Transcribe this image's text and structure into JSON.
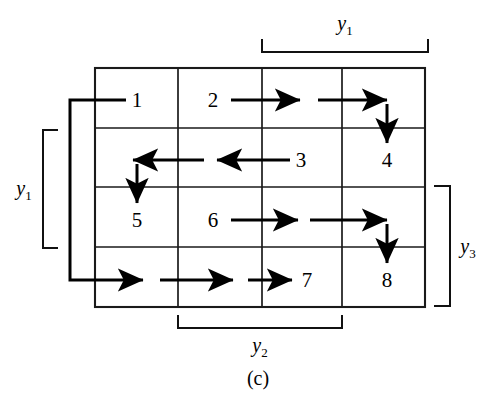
{
  "figure": {
    "caption": "(c)",
    "caption_position": {
      "x": 258,
      "y": 385
    },
    "background_color": "#ffffff",
    "line_color": "#000000"
  },
  "grid": {
    "columns": 4,
    "rows": 4,
    "left": 95,
    "right": 425,
    "top": 68,
    "bottom": 307,
    "column_dividers": [
      178,
      262,
      342
    ],
    "row_dividers": [
      128,
      187,
      247
    ],
    "outer_stroke_width": 2.1,
    "inner_stroke_width": 1.7
  },
  "cells": [
    {
      "label": "1",
      "x": 137,
      "y": 107,
      "row": 1,
      "col": 1
    },
    {
      "label": "2",
      "x": 213,
      "y": 107,
      "row": 1,
      "col": 2
    },
    {
      "label": "3",
      "x": 301,
      "y": 167,
      "row": 2,
      "col": 3
    },
    {
      "label": "4",
      "x": 387,
      "y": 167,
      "row": 2,
      "col": 4
    },
    {
      "label": "5",
      "x": 137,
      "y": 227,
      "row": 3,
      "col": 1
    },
    {
      "label": "6",
      "x": 213,
      "y": 227,
      "row": 3,
      "col": 2
    },
    {
      "label": "7",
      "x": 307,
      "y": 287,
      "row": 4,
      "col": 3
    },
    {
      "label": "8",
      "x": 387,
      "y": 287,
      "row": 4,
      "col": 4
    }
  ],
  "brackets": [
    {
      "id": "bracket-top",
      "label": "y",
      "subscript": "1",
      "orientation": "horizontal-top",
      "span_start": 262,
      "span_end": 428,
      "stem": 52,
      "tip": 39,
      "label_x": 345,
      "label_y": 30
    },
    {
      "id": "bracket-left",
      "label": "y",
      "subscript": "1",
      "orientation": "vertical-left",
      "span_start": 130,
      "span_end": 248,
      "stem": 43,
      "tip": 58,
      "label_x": 24,
      "label_y": 195
    },
    {
      "id": "bracket-right",
      "label": "y",
      "subscript": "3",
      "orientation": "vertical-right",
      "span_start": 186,
      "span_end": 306,
      "stem": 450,
      "tip": 434,
      "label_x": 468,
      "label_y": 253
    },
    {
      "id": "bracket-bottom",
      "label": "y",
      "subscript": "2",
      "orientation": "horizontal-bottom",
      "span_start": 178,
      "span_end": 342,
      "stem": 328,
      "tip": 315,
      "label_x": 260,
      "label_y": 352
    }
  ],
  "flow_arrows": [
    {
      "id": "arrow-entry-to-1",
      "type": "plain-line",
      "from": [
        70,
        100
      ],
      "to": [
        126,
        100
      ],
      "direction": "right"
    },
    {
      "id": "arrow-2-to-mid-row1",
      "type": "arrow",
      "from": [
        231,
        100
      ],
      "to": [
        306,
        100
      ],
      "direction": "right"
    },
    {
      "id": "arrow-mid-to-col4-row1",
      "type": "arrow",
      "from": [
        318,
        100
      ],
      "to": [
        393,
        100
      ],
      "direction": "right"
    },
    {
      "id": "arrow-down-to-4",
      "type": "arrow",
      "from": [
        387,
        104
      ],
      "to": [
        387,
        148
      ],
      "direction": "down"
    },
    {
      "id": "arrow-3-to-mid-row2",
      "type": "arrow",
      "from": [
        290,
        160
      ],
      "to": [
        212,
        160
      ],
      "direction": "left"
    },
    {
      "id": "arrow-mid-to-col1-row2",
      "type": "arrow",
      "from": [
        204,
        160
      ],
      "to": [
        130,
        160
      ],
      "direction": "left"
    },
    {
      "id": "arrow-down-to-5",
      "type": "arrow",
      "from": [
        137,
        164
      ],
      "to": [
        137,
        208
      ],
      "direction": "down"
    },
    {
      "id": "arrow-6-to-mid-row3",
      "type": "arrow",
      "from": [
        231,
        220
      ],
      "to": [
        303,
        220
      ],
      "direction": "right"
    },
    {
      "id": "arrow-mid-to-col4-row3",
      "type": "arrow",
      "from": [
        310,
        220
      ],
      "to": [
        392,
        220
      ],
      "direction": "right"
    },
    {
      "id": "arrow-down-to-8",
      "type": "arrow",
      "from": [
        387,
        224
      ],
      "to": [
        387,
        268
      ],
      "direction": "down"
    },
    {
      "id": "arrow-entry-row4-a",
      "type": "arrow",
      "from": [
        70,
        280
      ],
      "to": [
        148,
        280
      ],
      "direction": "right"
    },
    {
      "id": "arrow-row4-b",
      "type": "arrow",
      "from": [
        160,
        280
      ],
      "to": [
        238,
        280
      ],
      "direction": "right"
    },
    {
      "id": "arrow-row4-c",
      "type": "arrow",
      "from": [
        248,
        280
      ],
      "to": [
        297,
        280
      ],
      "direction": "right"
    }
  ],
  "feedback_path": {
    "id": "feedback-loop-left",
    "description": "vertical connector joining the row-4 entry to the cell-1 entry on the left side",
    "x": 70,
    "y_top": 100,
    "y_bottom": 280
  }
}
